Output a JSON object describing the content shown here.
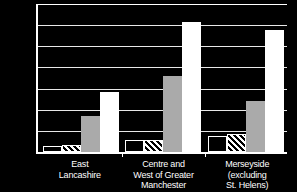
{
  "chart_data": {
    "type": "bar",
    "title": "",
    "subtitle": "",
    "xlabel": "",
    "ylabel": "",
    "ylim": [
      0,
      35000
    ],
    "ytick_step": 5000,
    "ytick_labels": [
      "35,000",
      "30,000",
      "25,000",
      "20,000",
      "15,000",
      "10,000",
      "5,000",
      "0"
    ],
    "ytick_values": [
      35000,
      30000,
      25000,
      20000,
      15000,
      10000,
      5000,
      0
    ],
    "grid": true,
    "legend": "none",
    "legend_position": "none",
    "categories": [
      "East\nLancashire",
      "Centre and\nWest of Greater\nManchester",
      "Merseyside\n(excluding\nSt. Helens)"
    ],
    "series": [
      {
        "name": "Series 1",
        "style": "outlined-white",
        "values": [
          1400,
          2900,
          3800
        ]
      },
      {
        "name": "Series 2",
        "style": "diagonal-hatch",
        "values": [
          1700,
          2900,
          4200
        ]
      },
      {
        "name": "Series 3",
        "style": "solid-gray",
        "values": [
          8500,
          17900,
          12000
        ]
      },
      {
        "name": "Series 4",
        "style": "solid-white",
        "values": [
          14100,
          30700,
          28800
        ]
      }
    ]
  },
  "colors": {
    "background": "#000000",
    "axis": "#ffffff",
    "gridline": "#e8e8e8",
    "text": "#ffffff",
    "series_gray": "#aaaaaa",
    "series_white": "#ffffff"
  }
}
